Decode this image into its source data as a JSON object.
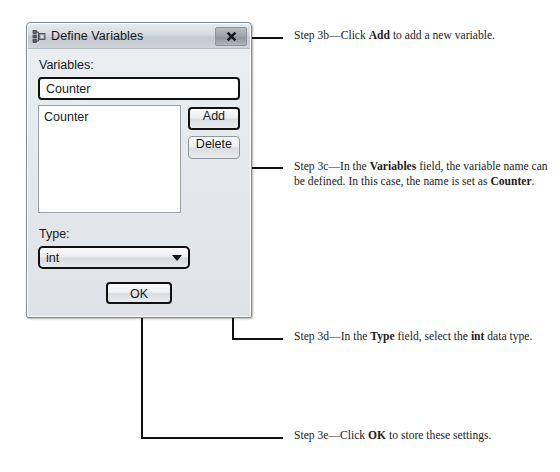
{
  "dialog": {
    "title": "Define Variables",
    "icon": "variables-tree-icon",
    "close_label": "x",
    "variables_label": "Variables:",
    "variables_input_value": "Counter",
    "variables_input_placeholder": "",
    "list_items": [
      "Counter"
    ],
    "add_label": "Add",
    "delete_label": "Delete",
    "type_label": "Type:",
    "type_value": "int",
    "type_options": [
      "int"
    ],
    "ok_label": "OK"
  },
  "annotations": [
    {
      "id": "step-3b",
      "parts": [
        {
          "text": "Step 3b—Click ",
          "bold": false
        },
        {
          "text": "Add",
          "bold": true
        },
        {
          "text": " to add a new variable.",
          "bold": false
        }
      ]
    },
    {
      "id": "step-3c",
      "parts": [
        {
          "text": "Step 3c—In the ",
          "bold": false
        },
        {
          "text": "Variables",
          "bold": true
        },
        {
          "text": " field, the variable name can be defined. In this case, the name is set as ",
          "bold": false
        },
        {
          "text": "Counter",
          "bold": true
        },
        {
          "text": ".",
          "bold": false
        }
      ]
    },
    {
      "id": "step-3d",
      "parts": [
        {
          "text": "Step 3d—In the ",
          "bold": false
        },
        {
          "text": "Type",
          "bold": true
        },
        {
          "text": " field, select the ",
          "bold": false
        },
        {
          "text": "int",
          "bold": true
        },
        {
          "text": " data type.",
          "bold": false
        }
      ]
    },
    {
      "id": "step-3e",
      "parts": [
        {
          "text": "Step 3e—Click ",
          "bold": false
        },
        {
          "text": "OK",
          "bold": true
        },
        {
          "text": " to store these settings.",
          "bold": false
        }
      ]
    }
  ],
  "colors": {
    "leader_line": "#111111",
    "dialog_face": "#e4e8ec",
    "text": "#16181b",
    "page_background": "#ffffff"
  }
}
